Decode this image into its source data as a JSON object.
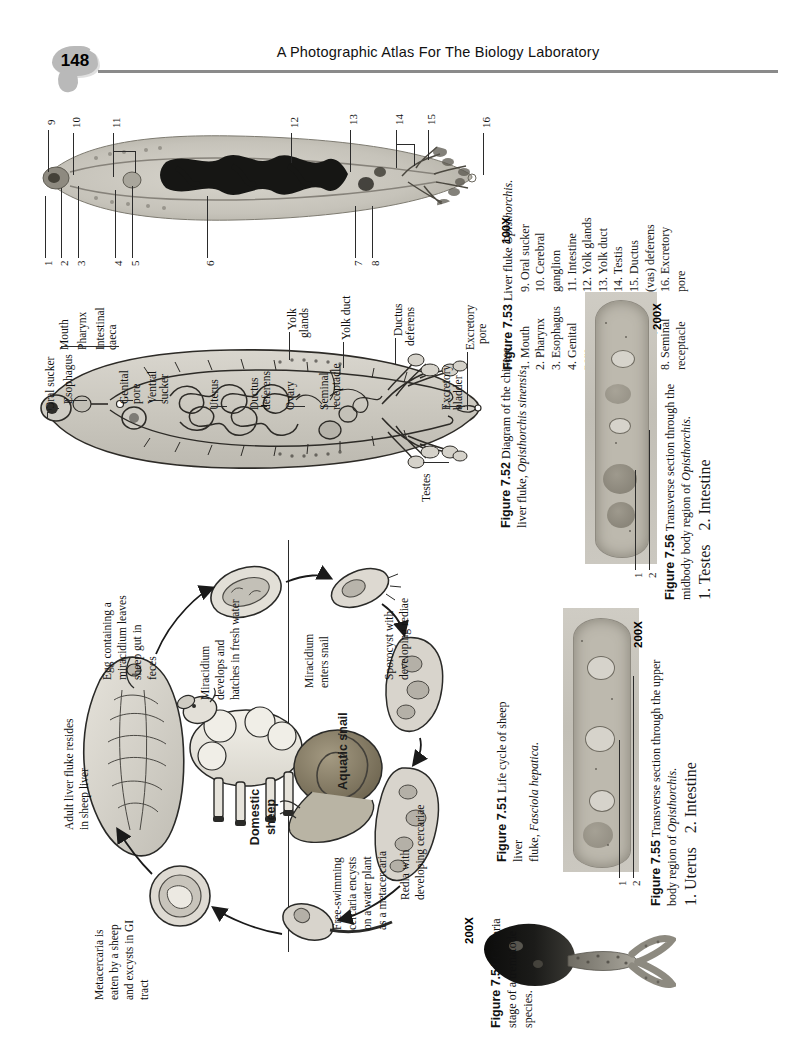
{
  "page": {
    "number": "148",
    "running_head": "A Photographic Atlas For The Biology Laboratory"
  },
  "figures": {
    "fig753": {
      "number": "Figure 7.53",
      "title": "Liver fluke",
      "species": "Opisthorchis.",
      "magnification": "100X",
      "labels_col1": [
        "1. Mouth",
        "2. Pharynx",
        "3. Esophagus",
        "4. Genital",
        "    pore",
        "5. Ventral",
        "    sucker",
        "6. Uterus",
        "7. Ovary",
        "8. Seminal",
        "    receptacle"
      ],
      "labels_col2": [
        "9. Oral sucker",
        "10. Cerebral",
        "      ganglion",
        "11. Intestine",
        "12. Yolk glands",
        "13. Yolk duct",
        "14. Testis",
        "15. Ductus",
        "      (vas) deferens",
        "16. Excretory",
        "      pore"
      ],
      "callouts": [
        "1",
        "2",
        "3",
        "4",
        "5",
        "6",
        "7",
        "8",
        "9",
        "10",
        "11",
        "12",
        "13",
        "14",
        "15",
        "16"
      ]
    },
    "fig752": {
      "number": "Figure 7.52",
      "caption_line1": "Diagram of the chinese",
      "caption_line2_pre": "liver fluke, ",
      "caption_species": "Opisthorchis sinensis.",
      "labels_left": [
        "Oral sucker",
        "Esophagus",
        "Genital",
        "pore",
        "Ventral",
        "sucker",
        "Uterus",
        "Ductus",
        "deferens",
        "Ovary",
        "Seminal",
        "receptacle",
        "Excretory",
        "bladder"
      ],
      "labels_top": [
        "Mouth",
        "Pharynx",
        "Intestinal",
        "caeca"
      ],
      "labels_right": [
        "Yolk",
        "glands",
        "Yolk duct",
        "Ductus",
        "deferens",
        "Testes",
        "Excretory",
        "pore"
      ]
    },
    "fig756": {
      "number": "Figure 7.56",
      "caption_line1": "Transverse section through the",
      "caption_line2_pre": "midbody body region of ",
      "caption_species": "Opisthorchis.",
      "label1": "1. Testes",
      "label2": "2. Intestine",
      "magnification": "200X",
      "callouts": [
        "1",
        "2"
      ]
    },
    "fig755": {
      "number": "Figure 7.55",
      "caption_line1": "Transverse section through the upper",
      "caption_line2_pre": "body region of ",
      "caption_species": "Opisthorchis.",
      "label1": "1. Uterus",
      "label2": "2. Intestine",
      "magnification": "200X",
      "callouts": [
        "1",
        "2"
      ]
    },
    "fig751": {
      "number": "Figure 7.51",
      "caption_line1": "Life cycle of sheep liver",
      "caption_line2_pre": "fluke, ",
      "caption_species": "Fasciola hepatica.",
      "stages": [
        "Adult liver fluke resides\nin sheep liver",
        "Egg containing a\nmiracidium leaves\nsheep gut in\nfeces",
        "Miracidium\ndevelops and\nhatches in fresh water",
        "Miracidium\nenters snail",
        "Sporocyst with\ndeveloping rediae",
        "Redia with\ndeveloping cercariae",
        "Free-swimming\ncercaria encysts\non a water plant\nas a metacercaria",
        "Metacercaria is\neaten by a sheep\nand excysts in GI\ntract"
      ],
      "host_sheep": "Domestic\nsheep",
      "host_snail": "Aquatic snail"
    },
    "fig754": {
      "number": "Figure 7.54",
      "caption_line1": "Cercaria",
      "caption_line2": "stage of a trematode",
      "caption_line3": "species.",
      "magnification": "200X"
    }
  }
}
